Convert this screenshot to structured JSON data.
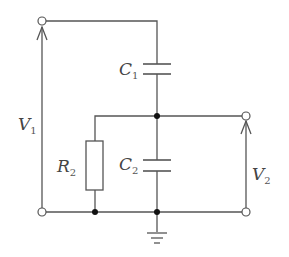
{
  "diagram": {
    "type": "circuit",
    "components": {
      "C1": {
        "label": "C",
        "subscript": "1"
      },
      "C2": {
        "label": "C",
        "subscript": "2"
      },
      "R": {
        "label": "R",
        "subscript": "2"
      },
      "V1": {
        "label": "V",
        "subscript": "1"
      },
      "V2": {
        "label": "V",
        "subscript": "2"
      }
    },
    "ground": "ground-symbol",
    "colors": {
      "wire": "#555555",
      "node": "#111111",
      "background": "#ffffff"
    }
  }
}
